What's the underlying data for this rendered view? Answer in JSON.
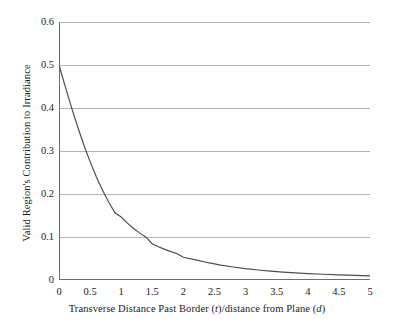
{
  "chart_data": {
    "type": "line",
    "title": "",
    "xlabel": "Transverse Distance Past Border (t)/distance from Plane (d)",
    "xlabel_parts": {
      "seg1": "Transverse Distance Past Border (",
      "var1": "t",
      "seg2": ")/distance from Plane (",
      "var2": "d",
      "seg3": ")"
    },
    "ylabel": "Valid Region's Contribution to Irradiance",
    "xlim": [
      0,
      5
    ],
    "ylim": [
      0,
      0.6
    ],
    "xticks": [
      0,
      0.5,
      1,
      1.5,
      2,
      2.5,
      3,
      3.5,
      4,
      4.5,
      5
    ],
    "xticklabels": [
      "0",
      "0.5",
      "1",
      "1.5",
      "2",
      "2.5",
      "3",
      "3.5",
      "4",
      "4.5",
      "5"
    ],
    "yticks": [
      0,
      0.1,
      0.2,
      0.3,
      0.4,
      0.5,
      0.6
    ],
    "yticklabels": [
      "0",
      "0.1",
      "0.2",
      "0.3",
      "0.4",
      "0.5",
      "0.6"
    ],
    "grid": "horizontal-major",
    "minor_xticks_step": 0.05,
    "legend": "none",
    "series": [
      {
        "name": "Valid Region's Contribution to Irradiance",
        "x": [
          0,
          0.05,
          0.1,
          0.15,
          0.2,
          0.25,
          0.3,
          0.35,
          0.4,
          0.45,
          0.5,
          0.6,
          0.7,
          0.8,
          0.9,
          1.0,
          1.1,
          1.2,
          1.3,
          1.4,
          1.5,
          1.6,
          1.7,
          1.8,
          1.9,
          2.0,
          2.2,
          2.4,
          2.6,
          2.8,
          3.0,
          3.2,
          3.4,
          3.6,
          3.8,
          4.0,
          4.25,
          4.5,
          4.75,
          5.0
        ],
        "values": [
          0.5,
          0.475,
          0.4502,
          0.4259,
          0.402,
          0.3788,
          0.3564,
          0.3348,
          0.3141,
          0.2943,
          0.2753,
          0.2402,
          0.2088,
          0.1808,
          0.1562,
          0.1464,
          0.1322,
          0.1198,
          0.109,
          0.0996,
          0.0838,
          0.0772,
          0.0713,
          0.066,
          0.0612,
          0.0528,
          0.0469,
          0.0402,
          0.0347,
          0.0302,
          0.0263,
          0.0233,
          0.0207,
          0.0185,
          0.0166,
          0.015,
          0.0134,
          0.012,
          0.0108,
          0.0098
        ],
        "formula": "0.5 * (1 - t / sqrt(1 + t^2))",
        "color": "#4d4d4d"
      }
    ],
    "colors": {
      "grid": "#b3b3b3",
      "axis": "#6e6e6e",
      "curve": "#4d4d4d",
      "text": "#1a1a1a",
      "background": "#ffffff"
    }
  }
}
